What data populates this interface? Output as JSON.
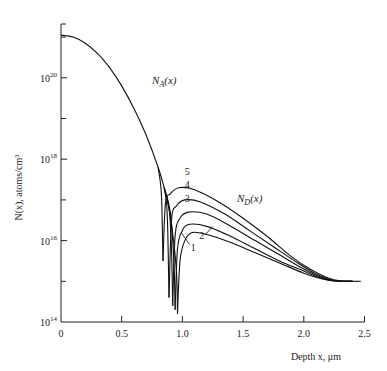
{
  "chart_data": {
    "type": "line",
    "title": "",
    "xlabel": "Depth x, μm",
    "ylabel": "N(x), atoms/cm³",
    "xlim": [
      0,
      2.5
    ],
    "ylim_log10": [
      14,
      21.3
    ],
    "yscale": "log",
    "grid": false,
    "x_ticks": [
      "0",
      "0.5",
      "1.0",
      "1.5",
      "2.0",
      "2.5"
    ],
    "x_tick_values": [
      0,
      0.5,
      1.0,
      1.5,
      2.0,
      2.5
    ],
    "y_ticks": [
      {
        "base": "10",
        "exp": "20",
        "log10": 20
      },
      {
        "base": "10",
        "exp": "18",
        "log10": 18
      },
      {
        "base": "10",
        "exp": "16",
        "log10": 16
      },
      {
        "base": "10",
        "exp": "14",
        "log10": 14
      }
    ],
    "y_minor_ticks_log10": [
      21,
      19,
      17,
      15
    ],
    "annotations": [
      {
        "text": "N",
        "sub": "A",
        "suffix": "(x)",
        "x": 0.75,
        "log10": 19.85
      },
      {
        "text": "N",
        "sub": "D",
        "suffix": "(x)",
        "x": 1.45,
        "log10": 16.95
      }
    ],
    "series": [
      {
        "name": "N_A(x)",
        "x": [
          0,
          0.1,
          0.2,
          0.3,
          0.4,
          0.5,
          0.6,
          0.7,
          0.8,
          0.85
        ],
        "log10": [
          21.05,
          21.0,
          20.85,
          20.6,
          20.25,
          19.8,
          19.25,
          18.6,
          17.8,
          17.3
        ]
      },
      {
        "name": "1",
        "junction_x": 0.96,
        "x": [
          0.85,
          0.9,
          0.95,
          0.96,
          0.98,
          1.02,
          1.08,
          1.2,
          1.4,
          1.6,
          1.8,
          2.0,
          2.1,
          2.2,
          2.3,
          2.4
        ],
        "log10": [
          17.3,
          16.6,
          15.3,
          14.2,
          15.5,
          16.0,
          16.2,
          16.15,
          15.95,
          15.7,
          15.45,
          15.2,
          15.1,
          15.03,
          15.0,
          15.0
        ]
      },
      {
        "name": "2",
        "junction_x": 0.94,
        "x": [
          0.85,
          0.9,
          0.93,
          0.94,
          0.96,
          1.0,
          1.06,
          1.2,
          1.4,
          1.6,
          1.8,
          2.0,
          2.1,
          2.2,
          2.3,
          2.4
        ],
        "log10": [
          17.3,
          16.7,
          15.5,
          14.3,
          15.8,
          16.25,
          16.4,
          16.35,
          16.1,
          15.8,
          15.5,
          15.25,
          15.12,
          15.04,
          15.0,
          15.0
        ]
      },
      {
        "name": "3",
        "junction_x": 0.92,
        "x": [
          0.85,
          0.89,
          0.91,
          0.92,
          0.94,
          0.98,
          1.05,
          1.2,
          1.4,
          1.6,
          1.8,
          2.0,
          2.1,
          2.2,
          2.3,
          2.4
        ],
        "log10": [
          17.3,
          16.8,
          15.8,
          14.4,
          16.1,
          16.55,
          16.7,
          16.65,
          16.35,
          16.0,
          15.65,
          15.3,
          15.15,
          15.05,
          15.0,
          15.0
        ]
      },
      {
        "name": "4",
        "junction_x": 0.89,
        "x": [
          0.85,
          0.87,
          0.88,
          0.89,
          0.91,
          0.95,
          1.02,
          1.15,
          1.35,
          1.55,
          1.75,
          1.95,
          2.1,
          2.2,
          2.3,
          2.4
        ],
        "log10": [
          17.3,
          16.9,
          16.2,
          14.6,
          16.5,
          16.85,
          17.0,
          16.95,
          16.65,
          16.25,
          15.85,
          15.45,
          15.18,
          15.06,
          15.0,
          15.0
        ]
      },
      {
        "name": "5",
        "junction_x": 0.84,
        "x": [
          0.8,
          0.82,
          0.83,
          0.84,
          0.86,
          0.9,
          0.97,
          1.1,
          1.3,
          1.5,
          1.7,
          1.9,
          2.05,
          2.2,
          2.3,
          2.4
        ],
        "log10": [
          17.8,
          17.4,
          16.9,
          15.5,
          16.9,
          17.15,
          17.3,
          17.25,
          16.95,
          16.55,
          16.1,
          15.6,
          15.3,
          15.08,
          15.01,
          15.0
        ]
      }
    ],
    "curve_labels": [
      {
        "text": "1",
        "x": 1.09,
        "log10": 15.75
      },
      {
        "text": "2",
        "x": 1.16,
        "log10": 16.05
      },
      {
        "text": "3",
        "x": 1.04,
        "log10": 16.95
      },
      {
        "text": "4",
        "x": 1.04,
        "log10": 17.3
      },
      {
        "text": "5",
        "x": 1.04,
        "log10": 17.6
      }
    ]
  }
}
